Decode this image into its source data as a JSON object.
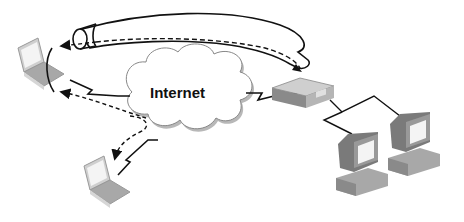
{
  "diagram": {
    "cloud": {
      "label": "Internet"
    },
    "nodes": [
      {
        "id": "remote-laptop-top",
        "type": "laptop"
      },
      {
        "id": "remote-laptop-bottom",
        "type": "laptop"
      },
      {
        "id": "vpn-gateway",
        "type": "router"
      },
      {
        "id": "office-desktop-1",
        "type": "desktop"
      },
      {
        "id": "office-desktop-2",
        "type": "desktop"
      }
    ],
    "links": [
      {
        "from": "remote-laptop-top",
        "to": "cloud",
        "style": "wireless-lightning"
      },
      {
        "from": "remote-laptop-bottom",
        "to": "cloud",
        "style": "wireless-lightning"
      },
      {
        "from": "cloud",
        "to": "vpn-gateway",
        "style": "wireless-lightning"
      },
      {
        "from": "vpn-gateway",
        "to": "office-desktop-1",
        "style": "wire"
      },
      {
        "from": "vpn-gateway",
        "to": "office-desktop-2",
        "style": "wire"
      },
      {
        "from": "vpn-gateway",
        "to": "remote-laptop-top",
        "style": "tunnel-dashed"
      },
      {
        "from": "cloud",
        "to": "remote-laptop-top",
        "style": "dashed-arrow"
      },
      {
        "from": "cloud",
        "to": "remote-laptop-bottom",
        "style": "dashed-arrow"
      }
    ],
    "colors": {
      "line": "#111111",
      "cloud_fill": "#ffffff",
      "cloud_shadow": "#b8b8b8",
      "device_gray": "#9a9a9a",
      "device_dark": "#6e6e6e",
      "screen": "#f2f2f2"
    }
  }
}
